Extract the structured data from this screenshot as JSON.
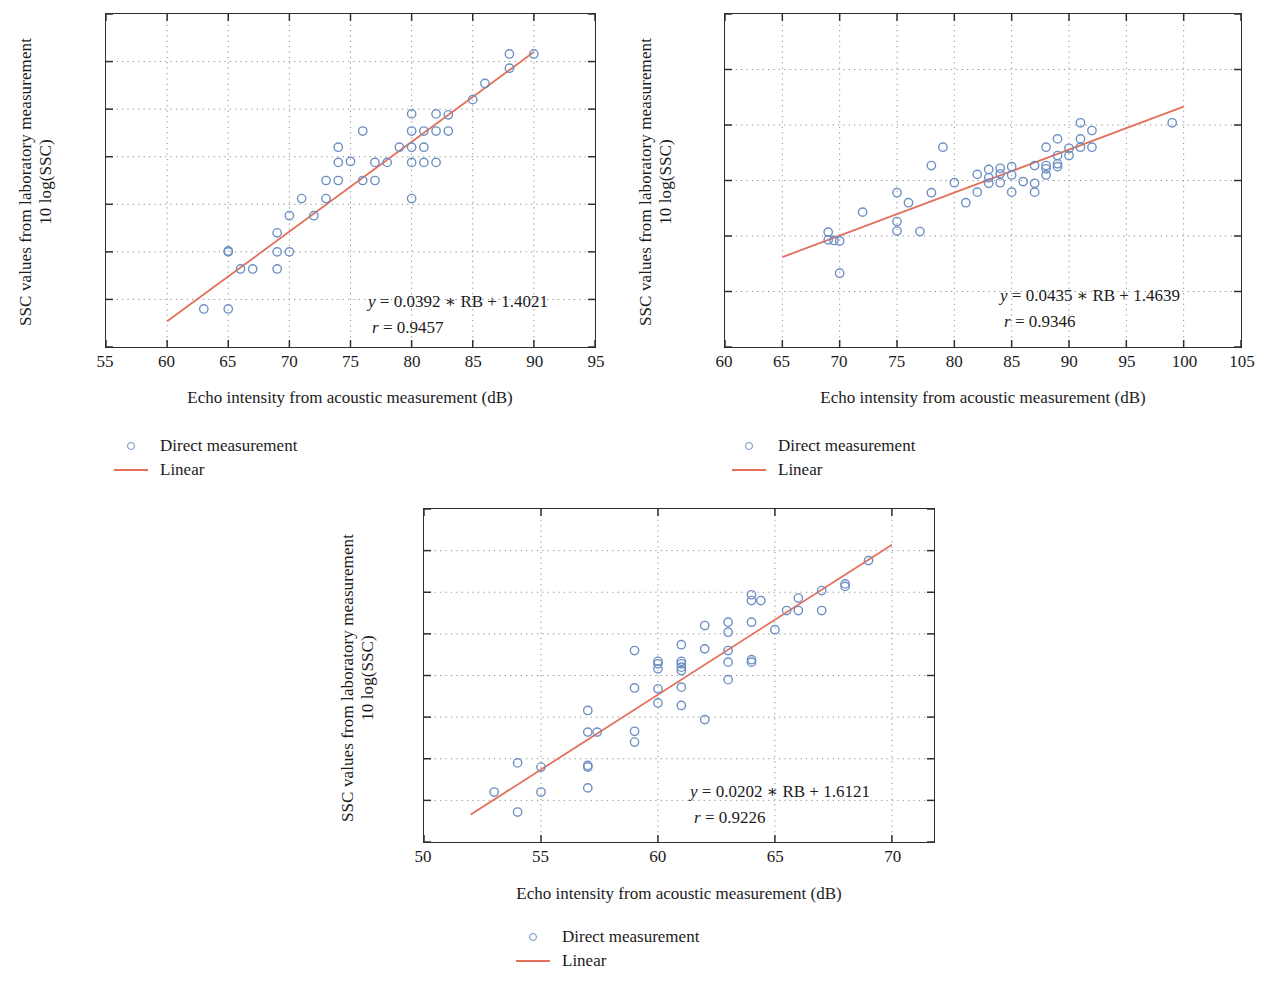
{
  "figure": {
    "background": "#ffffff",
    "marker_color": "#6E8FC4",
    "line_color": "#E3705A",
    "axis_color": "#2e2e2e",
    "grid_color": "#8a8a8a"
  },
  "legend": {
    "direct_label": "Direct measurement",
    "linear_label": "Linear",
    "marker_icon": "open-circle-icon",
    "line_icon": "line-segment-icon"
  },
  "panels": [
    {
      "id": "panel-a",
      "ylabel_line1": "SSC values from laboratory measurement",
      "ylabel_line2": "10 log(SSC)",
      "xlabel": "Echo intensity from acoustic measurement (dB)",
      "equation_y": "y",
      "equation_rest": " = 0.0392 ∗ RB + 1.4021",
      "correlation_r": "r",
      "correlation_rest": " = 0.9457"
    },
    {
      "id": "panel-b",
      "ylabel_line1": "SSC values from laboratory measurement",
      "ylabel_line2": "10 log(SSC)",
      "xlabel": "Echo intensity from acoustic measurement (dB)",
      "equation_y": "y",
      "equation_rest": " = 0.0435 ∗ RB + 1.4639",
      "correlation_r": "r",
      "correlation_rest": " = 0.9346"
    },
    {
      "id": "panel-c",
      "ylabel_line1": "SSC values from laboratory measurement",
      "ylabel_line2": "10 log(SSC)",
      "xlabel": "Echo intensity from acoustic measurement (dB)",
      "equation_y": "y",
      "equation_rest": " = 0.0202 ∗ RB + 1.6121",
      "correlation_r": "r",
      "correlation_rest": " = 0.9226"
    }
  ],
  "chart_data": [
    {
      "type": "scatter",
      "panel": "a",
      "title": "",
      "xlabel": "Echo intensity from acoustic measurement (dB)",
      "ylabel": "SSC values from laboratory measurement 10 log(SSC)",
      "xlim": [
        55,
        95
      ],
      "ylim": [
        38.5,
        42
      ],
      "xticks": [
        55,
        60,
        65,
        70,
        75,
        80,
        85,
        90,
        95
      ],
      "yticks": [
        38.5,
        39,
        39.5,
        40,
        40.5,
        41,
        41.5,
        42
      ],
      "grid": true,
      "grid_style": "dotted",
      "legend_position": "below-left",
      "series": [
        {
          "name": "Direct measurement",
          "marker": "open-circle",
          "color": "#6E8FC4",
          "points": [
            [
              63,
              38.9
            ],
            [
              65,
              38.9
            ],
            [
              65,
              39.5
            ],
            [
              65,
              39.51
            ],
            [
              66,
              39.32
            ],
            [
              67,
              39.32
            ],
            [
              69,
              39.32
            ],
            [
              69,
              39.5
            ],
            [
              69,
              39.7
            ],
            [
              70,
              39.5
            ],
            [
              70,
              39.88
            ],
            [
              71,
              40.06
            ],
            [
              72,
              39.88
            ],
            [
              73,
              40.06
            ],
            [
              73,
              40.25
            ],
            [
              74,
              40.25
            ],
            [
              74,
              40.44
            ],
            [
              74,
              40.6
            ],
            [
              75,
              40.45
            ],
            [
              76,
              40.25
            ],
            [
              76,
              40.77
            ],
            [
              77,
              40.25
            ],
            [
              77,
              40.44
            ],
            [
              78,
              40.44
            ],
            [
              79,
              40.6
            ],
            [
              80,
              40.06
            ],
            [
              80,
              40.44
            ],
            [
              80,
              40.6
            ],
            [
              80,
              40.77
            ],
            [
              80,
              40.95
            ],
            [
              81,
              40.44
            ],
            [
              81,
              40.6
            ],
            [
              81,
              40.77
            ],
            [
              82,
              40.44
            ],
            [
              82,
              40.77
            ],
            [
              82,
              40.95
            ],
            [
              83,
              40.77
            ],
            [
              83,
              40.94
            ],
            [
              85,
              41.1
            ],
            [
              86,
              41.27
            ],
            [
              88,
              41.43
            ],
            [
              88,
              41.58
            ],
            [
              90,
              41.58
            ]
          ]
        }
      ],
      "fit": {
        "name": "Linear",
        "color": "#E3705A",
        "equation": "y = 0.0392 * RB + 1.4021",
        "slope": 0.0392,
        "intercept": 1.4021,
        "r": 0.9457,
        "x_range": [
          60,
          90
        ],
        "y_range": [
          38.77,
          41.6
        ]
      }
    },
    {
      "type": "scatter",
      "panel": "b",
      "title": "",
      "xlabel": "Echo intensity from acoustic measurement (dB)",
      "ylabel": "SSC values from laboratory measurement 10 log(SSC)",
      "xlim": [
        60,
        105
      ],
      "ylim": [
        38,
        44
      ],
      "xticks": [
        60,
        65,
        70,
        75,
        80,
        85,
        90,
        95,
        100,
        105
      ],
      "yticks": [
        38,
        39,
        40,
        41,
        42,
        43,
        44
      ],
      "grid": true,
      "grid_style": "dotted",
      "legend_position": "below-left",
      "series": [
        {
          "name": "Direct measurement",
          "marker": "open-circle",
          "color": "#6E8FC4",
          "points": [
            [
              69,
              40.07
            ],
            [
              69,
              39.93
            ],
            [
              69.5,
              39.92
            ],
            [
              70,
              39.91
            ],
            [
              70,
              39.33
            ],
            [
              72,
              40.43
            ],
            [
              75,
              40.78
            ],
            [
              75,
              40.26
            ],
            [
              75,
              40.09
            ],
            [
              76,
              40.6
            ],
            [
              77,
              40.08
            ],
            [
              78,
              41.27
            ],
            [
              78,
              40.78
            ],
            [
              79,
              41.6
            ],
            [
              80,
              40.96
            ],
            [
              81,
              40.6
            ],
            [
              82,
              41.11
            ],
            [
              82,
              40.79
            ],
            [
              83,
              41.2
            ],
            [
              83,
              41.05
            ],
            [
              83,
              40.95
            ],
            [
              84,
              41.22
            ],
            [
              84,
              41.12
            ],
            [
              84,
              40.96
            ],
            [
              85,
              41.25
            ],
            [
              85,
              41.1
            ],
            [
              85,
              40.79
            ],
            [
              86,
              40.98
            ],
            [
              87,
              41.27
            ],
            [
              87,
              40.95
            ],
            [
              87,
              40.79
            ],
            [
              88,
              41.6
            ],
            [
              88,
              41.27
            ],
            [
              88,
              41.21
            ],
            [
              88,
              41.1
            ],
            [
              89,
              41.75
            ],
            [
              89,
              41.45
            ],
            [
              89,
              41.3
            ],
            [
              89,
              41.25
            ],
            [
              90,
              41.58
            ],
            [
              90,
              41.45
            ],
            [
              91,
              42.04
            ],
            [
              91,
              41.75
            ],
            [
              91,
              41.6
            ],
            [
              92,
              41.9
            ],
            [
              92,
              41.6
            ],
            [
              99,
              42.04
            ]
          ]
        }
      ],
      "fit": {
        "name": "Linear",
        "color": "#E3705A",
        "equation": "y = 0.0435 * RB + 1.4639",
        "slope": 0.0435,
        "intercept": 1.4639,
        "r": 0.9346,
        "x_range": [
          65,
          100
        ],
        "y_range": [
          39.62,
          42.33
        ]
      }
    },
    {
      "type": "scatter",
      "panel": "c",
      "title": "",
      "xlabel": "Echo intensity from acoustic measurement (dB)",
      "ylabel": "SSC values from laboratory measurement 10 log(SSC)",
      "xlim": [
        50,
        71.8
      ],
      "ylim": [
        42,
        46
      ],
      "xticks": [
        50,
        55,
        60,
        65,
        70
      ],
      "yticks": [
        42,
        42.5,
        43,
        43.5,
        44,
        44.5,
        45,
        45.5,
        46
      ],
      "grid": true,
      "grid_style": "dotted",
      "legend_position": "below-center",
      "series": [
        {
          "name": "Direct measurement",
          "marker": "open-circle",
          "color": "#6E8FC4",
          "points": [
            [
              53,
              42.6
            ],
            [
              54,
              42.36
            ],
            [
              54,
              42.95
            ],
            [
              55,
              42.6
            ],
            [
              55,
              42.9
            ],
            [
              57,
              42.65
            ],
            [
              57,
              42.9
            ],
            [
              57,
              42.92
            ],
            [
              57,
              43.32
            ],
            [
              57,
              43.58
            ],
            [
              57.4,
              43.32
            ],
            [
              59,
              43.2
            ],
            [
              59,
              43.33
            ],
            [
              59,
              43.85
            ],
            [
              59,
              44.3
            ],
            [
              60,
              43.67
            ],
            [
              60,
              43.84
            ],
            [
              60,
              44.08
            ],
            [
              60,
              44.14
            ],
            [
              60,
              44.17
            ],
            [
              61,
              43.64
            ],
            [
              61,
              43.86
            ],
            [
              61,
              44.06
            ],
            [
              61,
              44.1
            ],
            [
              61,
              44.14
            ],
            [
              61,
              44.17
            ],
            [
              61,
              44.37
            ],
            [
              62,
              43.47
            ],
            [
              62,
              44.32
            ],
            [
              62,
              44.6
            ],
            [
              63,
              43.95
            ],
            [
              63,
              44.16
            ],
            [
              63,
              44.3
            ],
            [
              63,
              44.52
            ],
            [
              63,
              44.64
            ],
            [
              64,
              44.16
            ],
            [
              64,
              44.19
            ],
            [
              64,
              44.64
            ],
            [
              64,
              44.9
            ],
            [
              64,
              44.97
            ],
            [
              64.4,
              44.9
            ],
            [
              65,
              44.55
            ],
            [
              65.5,
              44.78
            ],
            [
              66,
              44.93
            ],
            [
              66,
              44.78
            ],
            [
              67,
              44.78
            ],
            [
              67,
              45.02
            ],
            [
              68,
              45.07
            ],
            [
              68,
              45.1
            ],
            [
              69,
              45.38
            ]
          ]
        }
      ],
      "fit": {
        "name": "Linear",
        "color": "#E3705A",
        "equation": "y = 0.0202 * RB + 1.6121",
        "slope": 0.0202,
        "intercept": 1.6121,
        "r": 0.9226,
        "x_range": [
          52,
          70
        ],
        "y_range": [
          42.33,
          45.57
        ]
      }
    }
  ]
}
